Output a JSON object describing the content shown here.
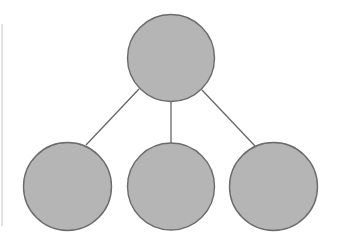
{
  "diagram": {
    "type": "tree",
    "colors": {
      "node_fill": "#b5b5b5",
      "node_stroke": "#6b6b6b",
      "edge_stroke": "#666666",
      "background": "#ffffff",
      "left_rule": "#e2e2e2"
    },
    "nodes": [
      {
        "id": "root",
        "cx": 171,
        "cy": 58,
        "r": 43.5,
        "label": ""
      },
      {
        "id": "child-left",
        "cx": 67.5,
        "cy": 186.5,
        "r": 44,
        "label": ""
      },
      {
        "id": "child-middle",
        "cx": 171,
        "cy": 186.5,
        "r": 43.5,
        "label": ""
      },
      {
        "id": "child-right",
        "cx": 273.5,
        "cy": 186.5,
        "r": 44,
        "label": ""
      }
    ],
    "edges": [
      {
        "from": "root",
        "to": "child-left",
        "x1": 139,
        "y1": 89,
        "x2": 86,
        "y2": 145
      },
      {
        "from": "root",
        "to": "child-middle",
        "x1": 171,
        "y1": 101.5,
        "x2": 171,
        "y2": 143
      },
      {
        "from": "root",
        "to": "child-right",
        "x1": 202,
        "y1": 90,
        "x2": 255,
        "y2": 146
      }
    ]
  }
}
